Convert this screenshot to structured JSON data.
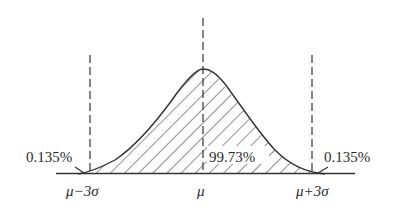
{
  "diagram": {
    "type": "normal-distribution",
    "vertical_lines": [
      {
        "id": "minus3sigma",
        "label": "μ−3σ"
      },
      {
        "id": "mean",
        "label": "μ"
      },
      {
        "id": "plus3sigma",
        "label": "μ+3σ"
      }
    ],
    "region_labels": {
      "left_tail": "0.135%",
      "center": "99.73%",
      "right_tail": "0.135%"
    },
    "colors": {
      "stroke": "#333333",
      "background": "#ffffff"
    }
  }
}
